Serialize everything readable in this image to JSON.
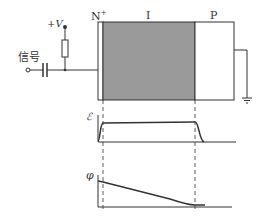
{
  "diagram": {
    "labels": {
      "supply": "+V",
      "signal": "信号",
      "n_region": "N",
      "n_superscript": "+",
      "i_region": "I",
      "p_region": "P",
      "field_axis": "ℰ",
      "potential_axis": "φ"
    },
    "colors": {
      "line": "#333333",
      "i_region_fill": "#9a9a9a",
      "background": "#ffffff"
    }
  }
}
